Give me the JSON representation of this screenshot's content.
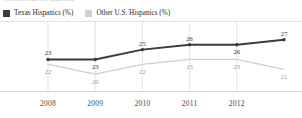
{
  "caption_sliver": "Percent of state/U.S. population",
  "legend": {
    "position": "top-left",
    "items": [
      {
        "label": "Texas Hispanics (%)",
        "color": "#3b3b3b",
        "swatch": "legend-swatch-dark"
      },
      {
        "label": "Other U.S. Hispanics (%)",
        "color": "#cfcfcf",
        "swatch": "legend-swatch-light"
      }
    ]
  },
  "chart_data": {
    "type": "line",
    "title": "",
    "subtitle": "",
    "xlabel": "",
    "ylabel": "",
    "grid": "vertical-only",
    "legend_position": "top-left",
    "x": [
      2008,
      2009,
      2010,
      2011,
      2012,
      2013
    ],
    "tick_labels": [
      "2008",
      "2009",
      "2010",
      "2011",
      "2012",
      ""
    ],
    "ylim": [
      18,
      29
    ],
    "series": [
      {
        "name": "Texas Hispanics (%)",
        "color": "#3b3b3b",
        "values": [
          23,
          23,
          25,
          26,
          26,
          27
        ],
        "labels": [
          "23",
          "23",
          "25",
          "26",
          "26",
          "27"
        ],
        "label_positions": [
          "above",
          "below",
          "above",
          "above",
          "below",
          "above"
        ]
      },
      {
        "name": "Other U.S. Hispanics (%)",
        "color": "#cfcfcf",
        "values": [
          22,
          20,
          22,
          23,
          23,
          21
        ],
        "labels": [
          "22",
          "20",
          "22",
          "23",
          "23",
          "21"
        ],
        "label_positions": [
          "below",
          "below",
          "below",
          "below",
          "below",
          "below"
        ]
      }
    ]
  },
  "axes": {
    "gridline_color": "#dcdcdc",
    "baseline_color": "#d9d9d9"
  }
}
